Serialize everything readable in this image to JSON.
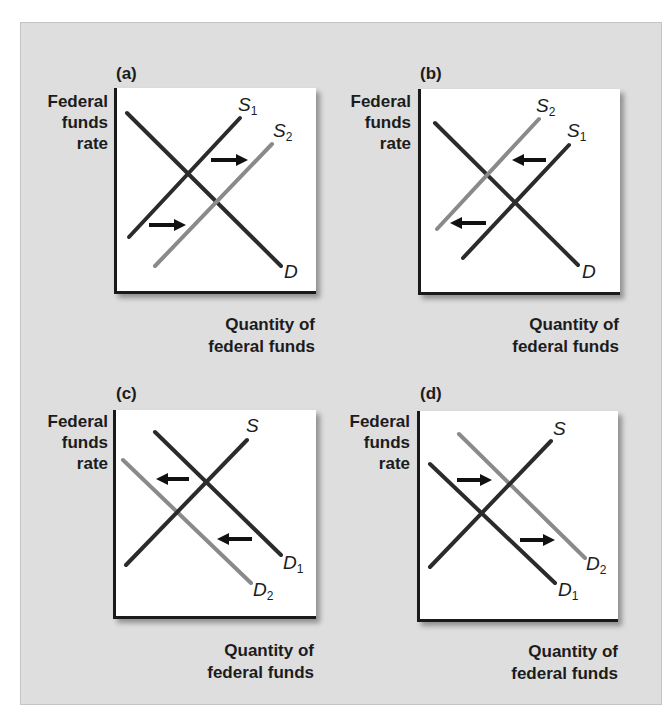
{
  "figure": {
    "background": "#dedede",
    "colors": {
      "original_curve": "#2b2b2b",
      "shifted_curve": "#8a8a8a",
      "arrow": "#111111",
      "axis": "#1a1a1a"
    }
  },
  "panels": [
    {
      "id": "a",
      "label": "(a)",
      "y_axis_label": [
        "Federal",
        "funds",
        "rate"
      ],
      "x_axis_label": [
        "Quantity of",
        "federal funds"
      ],
      "curves": [
        {
          "name": "D",
          "base": "D",
          "sub": ""
        },
        {
          "name": "S1",
          "base": "S",
          "sub": "1"
        },
        {
          "name": "S2",
          "base": "S",
          "sub": "2"
        }
      ],
      "shift": "supply shifts right (S1 to S2)"
    },
    {
      "id": "b",
      "label": "(b)",
      "y_axis_label": [
        "Federal",
        "funds",
        "rate"
      ],
      "x_axis_label": [
        "Quantity of",
        "federal funds"
      ],
      "curves": [
        {
          "name": "D",
          "base": "D",
          "sub": ""
        },
        {
          "name": "S1",
          "base": "S",
          "sub": "1"
        },
        {
          "name": "S2",
          "base": "S",
          "sub": "2"
        }
      ],
      "shift": "supply shifts left (S1 to S2)"
    },
    {
      "id": "c",
      "label": "(c)",
      "y_axis_label": [
        "Federal",
        "funds",
        "rate"
      ],
      "x_axis_label": [
        "Quantity of",
        "federal funds"
      ],
      "curves": [
        {
          "name": "S",
          "base": "S",
          "sub": ""
        },
        {
          "name": "D1",
          "base": "D",
          "sub": "1"
        },
        {
          "name": "D2",
          "base": "D",
          "sub": "2"
        }
      ],
      "shift": "demand shifts left (D1 to D2)"
    },
    {
      "id": "d",
      "label": "(d)",
      "y_axis_label": [
        "Federal",
        "funds",
        "rate"
      ],
      "x_axis_label": [
        "Quantity of",
        "federal funds"
      ],
      "curves": [
        {
          "name": "S",
          "base": "S",
          "sub": ""
        },
        {
          "name": "D1",
          "base": "D",
          "sub": "1"
        },
        {
          "name": "D2",
          "base": "D",
          "sub": "2"
        }
      ],
      "shift": "demand shifts right (D1 to D2)"
    }
  ]
}
